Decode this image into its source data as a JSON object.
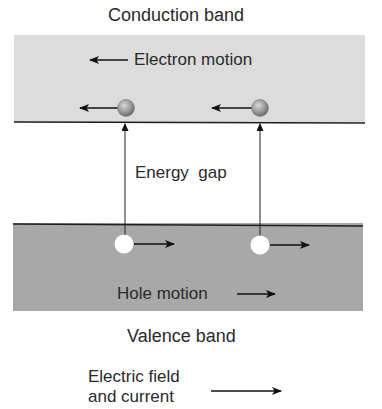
{
  "diagram": {
    "labels": {
      "conduction_band": "Conduction band",
      "electron_motion": "Electron motion",
      "energy_gap": "Energy  gap",
      "hole_motion": "Hole motion",
      "valence_band": "Valence band",
      "electric_field_line1": "Electric field",
      "electric_field_line2": "and current"
    },
    "colors": {
      "conduction_band_fill": "#dcdcdc",
      "valence_band_fill": "#a8a8a8",
      "band_edge_line": "#1e1e1e",
      "electron_fill": "#9a9a9a",
      "hole_fill": "#ffffff",
      "arrow": "#111111"
    },
    "elements": {
      "electrons": [
        {
          "x": 126,
          "y": 108,
          "direction": "left"
        },
        {
          "x": 260,
          "y": 108,
          "direction": "left"
        }
      ],
      "holes": [
        {
          "x": 124,
          "y": 244,
          "direction": "right"
        },
        {
          "x": 260,
          "y": 245,
          "direction": "right"
        }
      ],
      "excitation_arrows": [
        {
          "x": 125,
          "from_y": 244,
          "to_y": 122
        },
        {
          "x": 260,
          "from_y": 245,
          "to_y": 122
        }
      ]
    }
  }
}
